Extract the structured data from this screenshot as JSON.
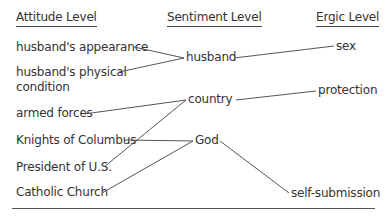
{
  "headers": {
    "attitude": "Attitude Level",
    "sentiment": "Sentiment Level",
    "ergic": "Ergic Level"
  },
  "attitudes": [
    "husband's appearance",
    "husband's physical",
    "condition",
    "armed forces",
    "Knights of Columbus",
    "President of U.S.",
    "Catholic Church"
  ],
  "sentiments": [
    "husband",
    "country",
    "God"
  ],
  "ergs": [
    "sex",
    "protection",
    "self-submission"
  ],
  "links": [
    {
      "from": "husband's appearance",
      "to": "husband"
    },
    {
      "from": "husband's physical condition",
      "to": "husband"
    },
    {
      "from": "husband",
      "to": "sex"
    },
    {
      "from": "armed forces",
      "to": "country"
    },
    {
      "from": "President of U.S.",
      "to": "country"
    },
    {
      "from": "country",
      "to": "protection"
    },
    {
      "from": "Knights of Columbus",
      "to": "God"
    },
    {
      "from": "Catholic Church",
      "to": "God"
    },
    {
      "from": "God",
      "to": "self-submission"
    }
  ],
  "colors": {
    "text": "#333333",
    "line": "#555555"
  }
}
